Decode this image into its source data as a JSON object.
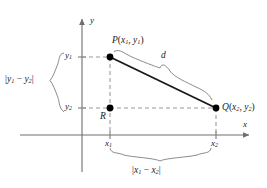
{
  "figure": {
    "background_color": "#ffffff",
    "axis_color": "#6e6e6e",
    "guide_color": "#9a9a9a",
    "segment_color": "#1a1a1a",
    "brace_color": "#8c8c8c",
    "point_color": "#000000",
    "text_color": "#1a1a1a"
  },
  "axes": {
    "x_label": "x",
    "y_label": "y",
    "origin_px": {
      "x": 82,
      "y": 135
    }
  },
  "points": {
    "P": {
      "label_main": "P",
      "label_args": "(x",
      "sub1": "1",
      "mid": ", y",
      "sub2": "1",
      "close": ")",
      "full": "P(x1, y1)",
      "px": {
        "x": 110,
        "y": 57
      }
    },
    "Q": {
      "label_main": "Q",
      "full": "Q(x2, y2)",
      "px": {
        "x": 216,
        "y": 108
      }
    },
    "R": {
      "label_main": "R",
      "full": "R",
      "px": {
        "x": 110,
        "y": 108
      }
    }
  },
  "ticks": {
    "y1": {
      "text": "y1",
      "base": "y",
      "sub": "1"
    },
    "y2": {
      "text": "y2",
      "base": "y",
      "sub": "2"
    },
    "x1": {
      "text": "x1",
      "base": "x",
      "sub": "1"
    },
    "x2": {
      "text": "x2",
      "base": "x",
      "sub": "2"
    }
  },
  "segments": {
    "distance": {
      "label": "d",
      "description": "hypotenuse-PQ"
    }
  },
  "braces": {
    "vertical": {
      "label": "|y1 - y2|",
      "parts": {
        "open": "|",
        "a": "y",
        "asub": "1",
        "op": " − ",
        "b": "y",
        "bsub": "2",
        "close": "|"
      }
    },
    "horizontal": {
      "label": "|x1 - x2|",
      "parts": {
        "open": "|",
        "a": "x",
        "asub": "1",
        "op": " − ",
        "b": "x",
        "bsub": "2",
        "close": "|"
      }
    },
    "diagonal": {
      "label": "d"
    }
  }
}
